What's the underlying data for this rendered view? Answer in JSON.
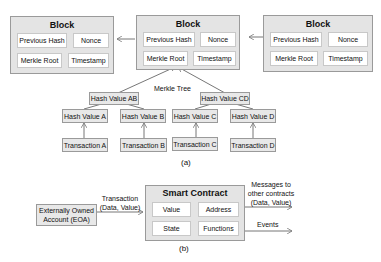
{
  "part_a": {
    "caption": "(a)",
    "blocks": [
      {
        "title": "Block",
        "prev_hash": "Previous Hash",
        "nonce": "Nonce",
        "merkle_root": "Merkle Root",
        "timestamp": "Timestamp"
      },
      {
        "title": "Block",
        "prev_hash": "Previous Hash",
        "nonce": "Nonce",
        "merkle_root": "Merkle Root",
        "timestamp": "Timestamp"
      },
      {
        "title": "Block",
        "prev_hash": "Previous Hash",
        "nonce": "Nonce",
        "merkle_root": "Merkle Root",
        "timestamp": "Timestamp"
      }
    ],
    "merkle_tree_label": "Merkle Tree",
    "hash_level2": [
      "Hash Value AB",
      "Hash Value CD"
    ],
    "hash_level1": [
      "Hash Value A",
      "Hash Value B",
      "Hash Value C",
      "Hash Value D"
    ],
    "transactions": [
      "Transaction A",
      "Transaction B",
      "Transaction C",
      "Transaction D"
    ]
  },
  "part_b": {
    "caption": "(b)",
    "eoa": {
      "line1": "Externally Owned",
      "line2": "Account (EOA)"
    },
    "transaction_label": {
      "line1": "Transaction",
      "line2": "(Data, Value)"
    },
    "smart_contract": {
      "title": "Smart Contract",
      "cells": [
        "Value",
        "Address",
        "State",
        "Functions"
      ]
    },
    "messages_label": {
      "line1": "Messages to",
      "line2": "other contracts",
      "line3": "(Data, Value)"
    },
    "events_label": "Events"
  }
}
